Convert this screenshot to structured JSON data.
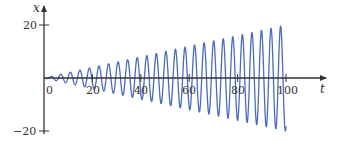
{
  "chart_data": {
    "type": "line",
    "title": "",
    "xlabel": "t",
    "ylabel": "x",
    "xlim": [
      0,
      100
    ],
    "ylim": [
      -20,
      20
    ],
    "x_ticks": [
      0,
      20,
      40,
      60,
      80,
      100
    ],
    "y_ticks": [
      20,
      -20
    ],
    "x_tick_labels": [
      "0",
      "20",
      "40",
      "60",
      "80",
      "100"
    ],
    "y_tick_labels": [
      "20",
      "−20"
    ],
    "grid": false,
    "legend": null,
    "series": [
      {
        "name": "x(t)",
        "color": "#4a6cc0",
        "description": "Oscillation with linearly growing amplitude (resonance), period about 4, amplitude from 0 at t=0 to about 20 at t=100, ending at about -20 at t=100",
        "model": {
          "amplitude_per_t": 0.2,
          "period": 3.95,
          "phase": 3.14159
        },
        "envelope": [
          {
            "t": 0,
            "amplitude": 0
          },
          {
            "t": 20,
            "amplitude": 4
          },
          {
            "t": 40,
            "amplitude": 8
          },
          {
            "t": 60,
            "amplitude": 12
          },
          {
            "t": 80,
            "amplitude": 16
          },
          {
            "t": 100,
            "amplitude": 20
          }
        ]
      }
    ]
  },
  "colors": {
    "axis": "#333333",
    "curve": "#4a6cc0",
    "background": "#ffffff"
  }
}
